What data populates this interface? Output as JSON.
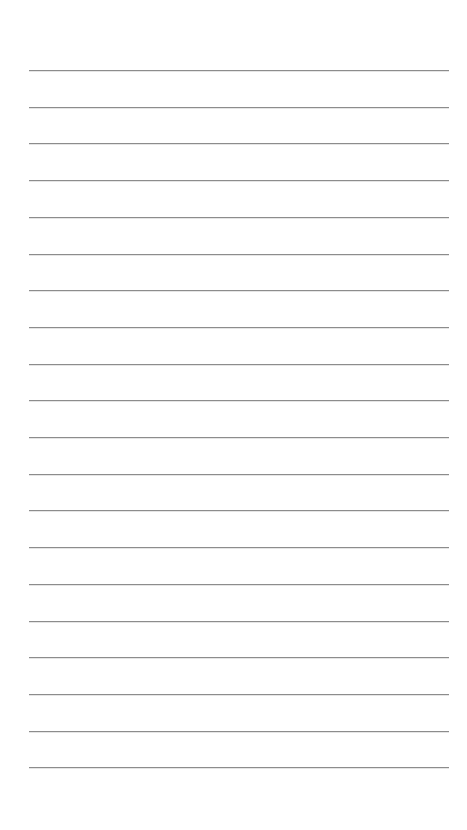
{
  "page": {
    "type": "lined-paper",
    "background_color": "#ffffff",
    "line_color": "#8c8c8c",
    "line_count": 20,
    "line_left": 29,
    "line_width": 420,
    "first_line_y": 70,
    "line_spacing": 36.7
  }
}
